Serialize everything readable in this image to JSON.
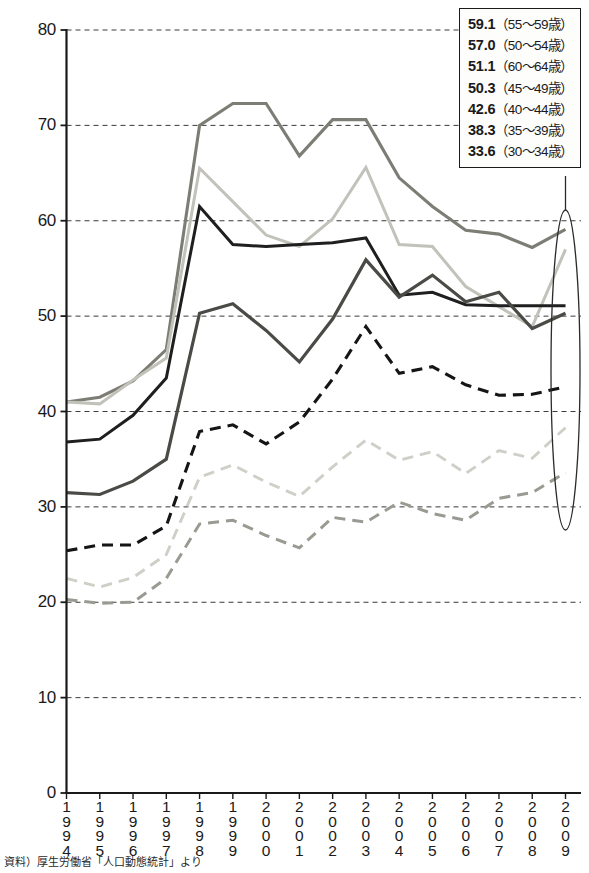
{
  "chart_data": {
    "type": "line",
    "title": "",
    "xlabel": "",
    "ylabel": "",
    "ylim": [
      0,
      80
    ],
    "y_ticks": [
      0,
      10,
      20,
      30,
      40,
      50,
      60,
      70,
      80
    ],
    "grid": true,
    "grid_style": "dashed-horizontal",
    "legend_position": "top-right-box",
    "categories": [
      "1994",
      "1995",
      "1996",
      "1997",
      "1998",
      "1999",
      "2000",
      "2001",
      "2002",
      "2003",
      "2004",
      "2005",
      "2006",
      "2007",
      "2008",
      "2009"
    ],
    "series": [
      {
        "name": "55~59歳",
        "final_value": "59.1",
        "style": "solid",
        "color": "#7d7d75",
        "width": 3.1,
        "values": [
          41.0,
          41.5,
          43.2,
          46.5,
          70.0,
          72.3,
          72.3,
          66.8,
          70.6,
          70.6,
          64.5,
          61.5,
          59.0,
          58.6,
          57.2,
          59.1
        ]
      },
      {
        "name": "50~54歳",
        "final_value": "57.0",
        "style": "solid",
        "color": "#c2c2bb",
        "width": 3.0,
        "values": [
          41.0,
          40.8,
          43.3,
          45.6,
          65.5,
          62.0,
          58.5,
          57.3,
          60.2,
          65.6,
          57.5,
          57.3,
          53.1,
          51.0,
          48.9,
          57.0
        ]
      },
      {
        "name": "60~64歳",
        "final_value": "51.1",
        "style": "solid",
        "color": "#1f1f1f",
        "width": 3.0,
        "values": [
          36.8,
          37.1,
          39.6,
          43.5,
          61.5,
          57.5,
          57.3,
          57.5,
          57.7,
          58.2,
          52.2,
          52.5,
          51.2,
          51.1,
          51.1,
          51.1
        ]
      },
      {
        "name": "45~49歳",
        "final_value": "50.3",
        "style": "solid",
        "color": "#4a4a46",
        "width": 3.2,
        "values": [
          31.5,
          31.3,
          32.7,
          35.0,
          50.3,
          51.3,
          48.5,
          45.2,
          49.7,
          55.9,
          52.0,
          54.3,
          51.5,
          52.5,
          48.7,
          50.3
        ]
      },
      {
        "name": "40~44歳",
        "final_value": "42.6",
        "style": "dashed",
        "color": "#151515",
        "width": 3.1,
        "values": [
          25.4,
          26.0,
          26.0,
          28.0,
          37.9,
          38.6,
          36.6,
          38.9,
          43.4,
          48.9,
          44.0,
          44.7,
          42.8,
          41.7,
          41.8,
          42.6
        ]
      },
      {
        "name": "35~39歳",
        "final_value": "38.3",
        "style": "dashed",
        "color": "#cfcfc8",
        "width": 2.9,
        "values": [
          22.5,
          21.6,
          22.6,
          25.0,
          33.1,
          34.4,
          32.6,
          31.1,
          34.2,
          37.0,
          34.9,
          35.8,
          33.5,
          35.9,
          35.1,
          38.3
        ]
      },
      {
        "name": "30~34歳",
        "final_value": "33.6",
        "style": "dashed",
        "color": "#9a9a92",
        "width": 3.0,
        "values": [
          20.3,
          19.9,
          20.0,
          22.5,
          28.2,
          28.6,
          27.0,
          25.7,
          28.9,
          28.4,
          30.5,
          29.3,
          28.6,
          30.9,
          31.5,
          33.6
        ]
      }
    ],
    "annotation": {
      "name": "endpoint-ellipse",
      "description": "vertical ellipse highlighting 2009 endpoints",
      "connector": "line from ellipse top to legend box"
    }
  },
  "legend": {
    "items": [
      {
        "value": "59.1",
        "range": "（55〜59歳）"
      },
      {
        "value": "57.0",
        "range": "（50〜54歳）"
      },
      {
        "value": "51.1",
        "range": "（60〜64歳）"
      },
      {
        "value": "50.3",
        "range": "（45〜49歳）"
      },
      {
        "value": "42.6",
        "range": "（40〜44歳）"
      },
      {
        "value": "38.3",
        "range": "（35〜39歳）"
      },
      {
        "value": "33.6",
        "range": "（30〜34歳）"
      }
    ]
  },
  "caption": {
    "text": "資料）厚生労働省「人口動態統計」より"
  }
}
